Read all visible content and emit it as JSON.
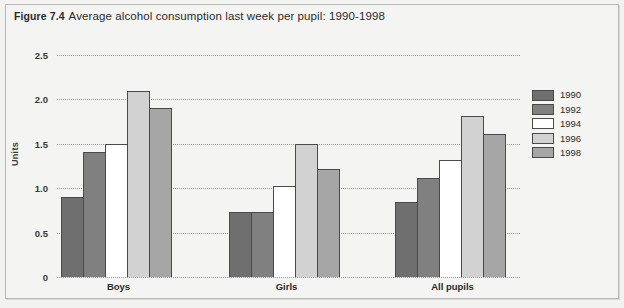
{
  "figure": {
    "number": "Figure 7.4",
    "title": "Average alcohol consumption last week per pupil: 1990-1998"
  },
  "chart_data": {
    "type": "bar",
    "title": "Average alcohol consumption last week per pupil: 1990-1998",
    "xlabel": "",
    "ylabel": "Units",
    "ylim": [
      0,
      2.5
    ],
    "yticks": [
      "0",
      "0.5",
      "1.0",
      "1.5",
      "2.0",
      "2.5"
    ],
    "ytick_values": [
      0,
      0.5,
      1.0,
      1.5,
      2.0,
      2.5
    ],
    "grid": true,
    "legend_position": "right",
    "categories": [
      "Boys",
      "Girls",
      "All pupils"
    ],
    "series": [
      {
        "name": "1990",
        "color": "#6f6f6f",
        "values": [
          0.9,
          0.73,
          0.84
        ]
      },
      {
        "name": "1992",
        "color": "#808080",
        "values": [
          1.41,
          0.73,
          1.12
        ]
      },
      {
        "name": "1994",
        "color": "#ffffff",
        "values": [
          1.5,
          1.02,
          1.32
        ]
      },
      {
        "name": "1996",
        "color": "#d2d2d2",
        "values": [
          2.1,
          1.5,
          1.81
        ]
      },
      {
        "name": "1998",
        "color": "#a6a6a6",
        "values": [
          1.9,
          1.22,
          1.61
        ]
      }
    ]
  }
}
